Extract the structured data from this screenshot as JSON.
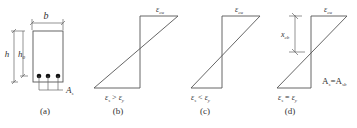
{
  "figure": {
    "panels": [
      {
        "id": "a",
        "caption": "(a)",
        "type": "cross-section",
        "labels": {
          "width": "b",
          "height": "h",
          "effective_depth_main": "h",
          "effective_depth_sub": "0",
          "steel_area_main": "A",
          "steel_area_sub": "s"
        },
        "rebar_count": 3
      },
      {
        "id": "b",
        "caption": "(b)",
        "type": "strain-diagram",
        "top_strain_main": "ε",
        "top_strain_sub": "cu",
        "condition": {
          "lhs_main": "ε",
          "lhs_sub": "s",
          "op": ">",
          "rhs_main": "ε",
          "rhs_sub": "y"
        }
      },
      {
        "id": "c",
        "caption": "(c)",
        "type": "strain-diagram",
        "top_strain_main": "ε",
        "top_strain_sub": "cu",
        "condition": {
          "lhs_main": "ε",
          "lhs_sub": "s",
          "op": "<",
          "rhs_main": "ε",
          "rhs_sub": "y"
        }
      },
      {
        "id": "d",
        "caption": "(d)",
        "type": "strain-diagram",
        "top_strain_main": "ε",
        "top_strain_sub": "cu",
        "neutral_axis_depth_main": "x",
        "neutral_axis_depth_sub": "cb",
        "condition": {
          "lhs_main": "ε",
          "lhs_sub": "s",
          "op": "=",
          "rhs_main": "ε",
          "rhs_sub": "y"
        },
        "note": {
          "lhs_main": "A",
          "lhs_sub": "s",
          "op": "=",
          "rhs_main": "A",
          "rhs_sub": "sb"
        }
      }
    ]
  }
}
